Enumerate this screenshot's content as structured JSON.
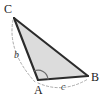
{
  "figure": {
    "name": "triangle-abc-with-labeled-sides",
    "type": "geometry-diagram",
    "background_color": "#ffffff",
    "fill_color": "#dcdcdc",
    "edge_color": "#2b2b2b",
    "guide_color": "#9a9a9a",
    "vertices": [
      {
        "id": "C",
        "label": "C",
        "x": 14,
        "y": 18
      },
      {
        "id": "A",
        "label": "A",
        "x": 38,
        "y": 80
      },
      {
        "id": "B",
        "label": "B",
        "x": 88,
        "y": 76
      }
    ],
    "sides": [
      {
        "id": "b",
        "label": "b",
        "from": "C",
        "to": "A",
        "style": "dashed-arc"
      },
      {
        "id": "c",
        "label": "c",
        "from": "A",
        "to": "B",
        "style": "dashed-arc"
      }
    ],
    "angles": [
      {
        "at": "A",
        "label": "",
        "style": "arc",
        "marks": 1
      }
    ],
    "labels": {
      "vertex_c": "C",
      "vertex_a": "A",
      "vertex_b": "B",
      "side_b": "b",
      "side_c": "c"
    }
  }
}
